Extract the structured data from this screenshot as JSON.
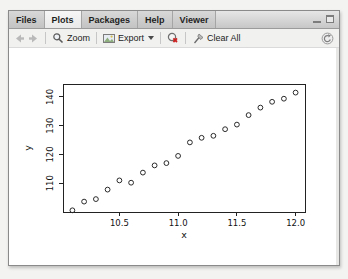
{
  "pane": {
    "tabs": [
      {
        "label": "Files",
        "active": false
      },
      {
        "label": "Plots",
        "active": true
      },
      {
        "label": "Packages",
        "active": false
      },
      {
        "label": "Help",
        "active": false
      },
      {
        "label": "Viewer",
        "active": false
      }
    ],
    "toolbar": {
      "zoom_label": "Zoom",
      "export_label": "Export",
      "clear_all_label": "Clear All"
    },
    "icons": {
      "back": "left-arrow",
      "forward": "right-arrow",
      "zoom": "magnifier",
      "export": "image",
      "remove_plot": "red-x-circle",
      "clear_all": "broom",
      "refresh": "circular-arrow",
      "minimize": "dash",
      "maximize": "square"
    }
  },
  "colors": {
    "tabbar_bg": "#d4d4d4",
    "active_tab_bg": "#efefef",
    "toolbar_bg": "#f1f1f0",
    "pane_border": "#8a8a8a",
    "plot_stroke": "#222222",
    "remove_icon_accent": "#cc2222"
  },
  "chart_data": {
    "type": "scatter",
    "x": [
      10.1,
      10.2,
      10.3,
      10.4,
      10.5,
      10.6,
      10.7,
      10.8,
      10.9,
      11.0,
      11.1,
      11.2,
      11.3,
      11.4,
      11.5,
      11.6,
      11.7,
      11.8,
      11.9,
      12.0
    ],
    "y": [
      100.6,
      103.6,
      104.5,
      107.8,
      111.0,
      110.2,
      113.7,
      116.2,
      117.0,
      119.5,
      124.2,
      125.8,
      126.5,
      128.8,
      130.4,
      133.7,
      136.3,
      138.3,
      139.4,
      141.5
    ],
    "title": "",
    "xlabel": "x",
    "ylabel": "y",
    "xticks": [
      10.5,
      11.0,
      11.5,
      12.0
    ],
    "xtick_labels": [
      "10.5",
      "11.0",
      "11.5",
      "12.0"
    ],
    "yticks": [
      110,
      120,
      130,
      140
    ],
    "ytick_labels": [
      "110",
      "120",
      "130",
      "140"
    ],
    "xlim": [
      10.02,
      12.08
    ],
    "ylim": [
      100,
      144.5
    ],
    "grid": false,
    "legend": null,
    "marker": "open-circle"
  }
}
